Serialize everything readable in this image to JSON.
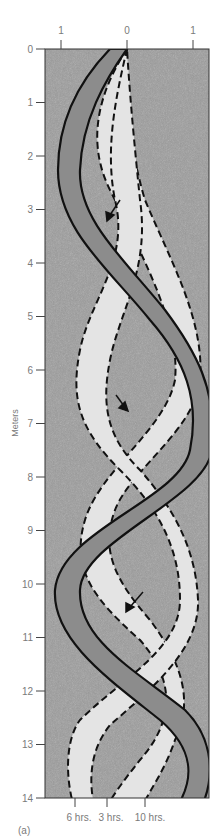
{
  "figure": {
    "panel_label": "(a)",
    "y_axis": {
      "title": "Meters",
      "ticks": [
        "0",
        "1",
        "2",
        "3",
        "4",
        "5",
        "6",
        "7",
        "8",
        "9",
        "10",
        "11",
        "12",
        "13",
        "14"
      ]
    },
    "top_axis": {
      "ticks": [
        "1",
        "0",
        "1"
      ]
    },
    "bottom_labels": [
      "6 hrs.",
      "3 hrs.",
      "10 hrs."
    ],
    "colors": {
      "background": "#9a9a9a",
      "dark_band": "#8a8a8a",
      "light_band": "#e6e6e6",
      "outline": "#111111"
    }
  },
  "chart_data": {
    "type": "diagram",
    "title": "",
    "ylabel": "Meters",
    "ylim": [
      0,
      14
    ],
    "xlim": [
      -1,
      1
    ],
    "top_tick_labels": [
      "1",
      "0",
      "1"
    ],
    "series": [
      {
        "name": "10 hrs.",
        "style": "dark band, solid outline",
        "description": "sinusoidal band, starts at 0 at top, bottom position near 10 hrs. tick"
      },
      {
        "name": "6 hrs.",
        "style": "light band, dashed outline",
        "description": "sinusoidal band phase-shifted, ends near 6 hrs. tick"
      },
      {
        "name": "3 hrs.",
        "style": "light band, dashed outline",
        "description": "sinusoidal band phase-shifted, ends near 3 hrs. tick"
      }
    ],
    "annotations": [
      "arrow near 3 m",
      "arrow near 6.8 m",
      "arrow near 10.8 m"
    ]
  }
}
